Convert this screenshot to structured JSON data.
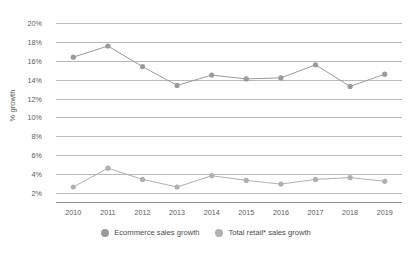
{
  "chart_data": {
    "type": "line",
    "title": "",
    "xlabel": "",
    "ylabel": "% growth",
    "categories": [
      "2010",
      "2011",
      "2012",
      "2013",
      "2014",
      "2015",
      "2016",
      "2017",
      "2018",
      "2019"
    ],
    "ylim": [
      1,
      21
    ],
    "yticks": [
      "2%",
      "4%",
      "6%",
      "8%",
      "10%",
      "12%",
      "14%",
      "16%",
      "18%",
      "20%"
    ],
    "ytick_values": [
      2,
      4,
      6,
      8,
      10,
      12,
      14,
      16,
      18,
      20
    ],
    "grid": true,
    "legend_position": "bottom",
    "series": [
      {
        "name": "Ecommerce sales growth",
        "color": "#9a9a9a",
        "values": [
          16.4,
          17.6,
          15.4,
          13.4,
          14.5,
          14.1,
          14.2,
          15.6,
          13.3,
          14.6
        ]
      },
      {
        "name": "Total retail* sales growth",
        "color": "#b0b0b0",
        "values": [
          2.6,
          4.6,
          3.4,
          2.6,
          3.8,
          3.3,
          2.9,
          3.4,
          3.6,
          3.2
        ]
      }
    ]
  },
  "colors": {
    "gridline": "#b9b9b9",
    "axis": "#8e8e8e",
    "text": "#5a5a5a",
    "series_1": "#9a9a9a",
    "series_2": "#b0b0b0",
    "background": "#ffffff"
  }
}
